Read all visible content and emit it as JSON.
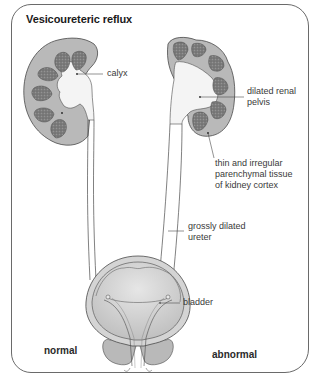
{
  "title": "Vesicoureteric reflux",
  "labels": {
    "calyx": "calyx",
    "dilated_renal_pelvis_line1": "dilated renal",
    "dilated_renal_pelvis_line2": "pelvis",
    "cortex_line1": "thin and irregular",
    "cortex_line2": "parenchymal tissue",
    "cortex_line3": "of kidney cortex",
    "ureter_line1": "grossly dilated",
    "ureter_line2": "ureter",
    "bladder": "bladder"
  },
  "sides": {
    "left": "normal",
    "right": "abnormal"
  },
  "colors": {
    "cortex": "#b9b9b9",
    "pyramid": "#7d7d7d",
    "pelvis": "#f4f4f4",
    "outline": "#4a4a4a",
    "frame": "#6a6a6a",
    "bladder_fill": "#c8c8c8"
  }
}
